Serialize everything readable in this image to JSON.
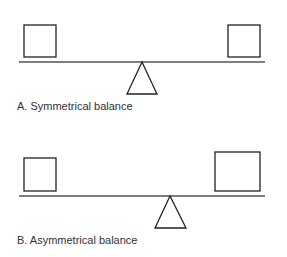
{
  "figure": {
    "panels": [
      {
        "id": "A",
        "caption": "A. Symmetrical balance",
        "beam": {
          "x1": 19,
          "x2": 265,
          "y": 62
        },
        "fulcrum": {
          "apex_x": 142,
          "apex_y": 62,
          "base_y": 94,
          "half_width": 15
        },
        "weights": [
          {
            "side": "left",
            "x": 24,
            "y": 25,
            "w": 32,
            "h": 32
          },
          {
            "side": "right",
            "x": 228,
            "y": 25,
            "w": 32,
            "h": 32
          }
        ],
        "caption_pos": {
          "x": 17,
          "y": 100
        }
      },
      {
        "id": "B",
        "caption": "B. Asymmetrical balance",
        "beam": {
          "x1": 19,
          "x2": 265,
          "y": 196
        },
        "fulcrum": {
          "apex_x": 170,
          "apex_y": 196,
          "base_y": 228,
          "half_width": 15.5
        },
        "weights": [
          {
            "side": "left",
            "x": 24,
            "y": 158,
            "w": 32,
            "h": 33
          },
          {
            "side": "right",
            "x": 215,
            "y": 152,
            "w": 45,
            "h": 39
          }
        ],
        "caption_pos": {
          "x": 17,
          "y": 234
        }
      }
    ],
    "colors": {
      "beam": "#555555",
      "outline": "#222222",
      "text": "#333333",
      "background": "#ffffff"
    }
  }
}
